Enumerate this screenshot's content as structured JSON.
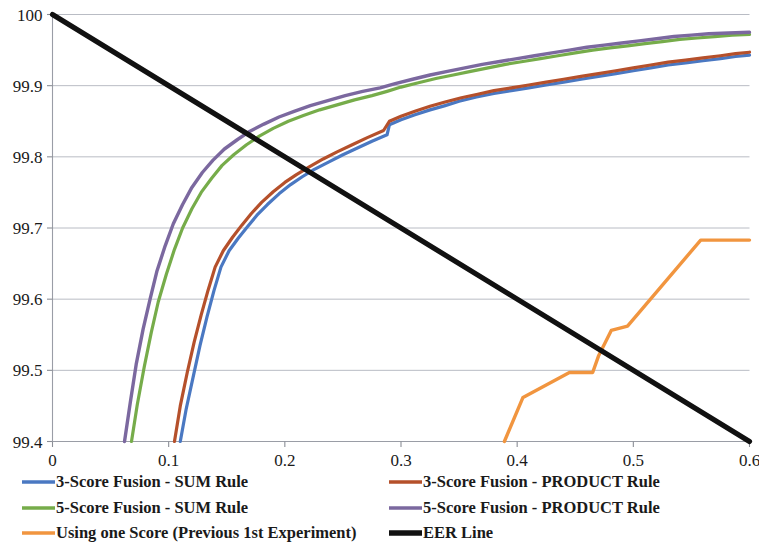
{
  "chart_data": {
    "type": "line",
    "title": "",
    "xlabel": "",
    "ylabel": "",
    "xlim": [
      0,
      0.6
    ],
    "ylim": [
      99.4,
      100
    ],
    "grid": true,
    "legend_position": "bottom",
    "x_ticks": [
      "0",
      "0.1",
      "0.2",
      "0.3",
      "0.4",
      "0.5",
      "0.6"
    ],
    "x_tick_values": [
      0,
      0.1,
      0.2,
      0.3,
      0.4,
      0.5,
      0.6
    ],
    "y_ticks": [
      "99.4",
      "99.5",
      "99.6",
      "99.7",
      "99.8",
      "99.9",
      "100"
    ],
    "y_tick_values": [
      99.4,
      99.5,
      99.6,
      99.7,
      99.8,
      99.9,
      100
    ],
    "series": [
      {
        "name": "3-Score Fusion - SUM Rule",
        "color": "#4A78C2",
        "width": 3.2,
        "points": [
          [
            0.11,
            99.4
          ],
          [
            0.115,
            99.445
          ],
          [
            0.121,
            99.49
          ],
          [
            0.127,
            99.535
          ],
          [
            0.133,
            99.575
          ],
          [
            0.139,
            99.612
          ],
          [
            0.145,
            99.645
          ],
          [
            0.152,
            99.668
          ],
          [
            0.16,
            99.686
          ],
          [
            0.168,
            99.702
          ],
          [
            0.176,
            99.718
          ],
          [
            0.185,
            99.733
          ],
          [
            0.195,
            99.748
          ],
          [
            0.205,
            99.761
          ],
          [
            0.215,
            99.772
          ],
          [
            0.225,
            99.782
          ],
          [
            0.238,
            99.793
          ],
          [
            0.25,
            99.803
          ],
          [
            0.262,
            99.812
          ],
          [
            0.275,
            99.822
          ],
          [
            0.288,
            99.831
          ],
          [
            0.29,
            99.845
          ],
          [
            0.3,
            99.852
          ],
          [
            0.312,
            99.859
          ],
          [
            0.325,
            99.866
          ],
          [
            0.338,
            99.872
          ],
          [
            0.35,
            99.878
          ],
          [
            0.365,
            99.884
          ],
          [
            0.38,
            99.889
          ],
          [
            0.395,
            99.893
          ],
          [
            0.41,
            99.897
          ],
          [
            0.425,
            99.901
          ],
          [
            0.44,
            99.905
          ],
          [
            0.455,
            99.909
          ],
          [
            0.47,
            99.913
          ],
          [
            0.485,
            99.917
          ],
          [
            0.5,
            99.921
          ],
          [
            0.515,
            99.925
          ],
          [
            0.53,
            99.929
          ],
          [
            0.545,
            99.932
          ],
          [
            0.56,
            99.935
          ],
          [
            0.575,
            99.938
          ],
          [
            0.588,
            99.941
          ],
          [
            0.6,
            99.943
          ]
        ]
      },
      {
        "name": "3-Score Fusion - PRODUCT Rule",
        "color": "#B5502B",
        "width": 3.2,
        "points": [
          [
            0.105,
            99.4
          ],
          [
            0.11,
            99.45
          ],
          [
            0.116,
            99.497
          ],
          [
            0.122,
            99.54
          ],
          [
            0.128,
            99.578
          ],
          [
            0.134,
            99.613
          ],
          [
            0.14,
            99.645
          ],
          [
            0.147,
            99.668
          ],
          [
            0.155,
            99.687
          ],
          [
            0.163,
            99.704
          ],
          [
            0.171,
            99.72
          ],
          [
            0.18,
            99.736
          ],
          [
            0.19,
            99.751
          ],
          [
            0.2,
            99.764
          ],
          [
            0.21,
            99.775
          ],
          [
            0.221,
            99.786
          ],
          [
            0.233,
            99.797
          ],
          [
            0.245,
            99.807
          ],
          [
            0.258,
            99.817
          ],
          [
            0.271,
            99.827
          ],
          [
            0.285,
            99.837
          ],
          [
            0.29,
            99.85
          ],
          [
            0.3,
            99.857
          ],
          [
            0.312,
            99.864
          ],
          [
            0.325,
            99.871
          ],
          [
            0.338,
            99.877
          ],
          [
            0.352,
            99.883
          ],
          [
            0.366,
            99.888
          ],
          [
            0.38,
            99.893
          ],
          [
            0.395,
            99.897
          ],
          [
            0.41,
            99.901
          ],
          [
            0.425,
            99.905
          ],
          [
            0.44,
            99.909
          ],
          [
            0.455,
            99.913
          ],
          [
            0.47,
            99.917
          ],
          [
            0.485,
            99.921
          ],
          [
            0.5,
            99.925
          ],
          [
            0.515,
            99.929
          ],
          [
            0.53,
            99.933
          ],
          [
            0.545,
            99.936
          ],
          [
            0.56,
            99.939
          ],
          [
            0.575,
            99.942
          ],
          [
            0.588,
            99.945
          ],
          [
            0.6,
            99.947
          ]
        ]
      },
      {
        "name": "5-Score Fusion - SUM Rule",
        "color": "#76AC4A",
        "width": 3.2,
        "points": [
          [
            0.068,
            99.4
          ],
          [
            0.073,
            99.452
          ],
          [
            0.079,
            99.505
          ],
          [
            0.085,
            99.553
          ],
          [
            0.091,
            99.596
          ],
          [
            0.098,
            99.635
          ],
          [
            0.105,
            99.67
          ],
          [
            0.112,
            99.7
          ],
          [
            0.12,
            99.727
          ],
          [
            0.128,
            99.75
          ],
          [
            0.137,
            99.77
          ],
          [
            0.146,
            99.788
          ],
          [
            0.156,
            99.803
          ],
          [
            0.167,
            99.817
          ],
          [
            0.178,
            99.829
          ],
          [
            0.19,
            99.84
          ],
          [
            0.203,
            99.85
          ],
          [
            0.216,
            99.858
          ],
          [
            0.23,
            99.866
          ],
          [
            0.245,
            99.873
          ],
          [
            0.26,
            99.88
          ],
          [
            0.275,
            99.886
          ],
          [
            0.288,
            99.892
          ],
          [
            0.3,
            99.898
          ],
          [
            0.315,
            99.904
          ],
          [
            0.33,
            99.91
          ],
          [
            0.345,
            99.915
          ],
          [
            0.36,
            99.92
          ],
          [
            0.375,
            99.925
          ],
          [
            0.39,
            99.93
          ],
          [
            0.405,
            99.934
          ],
          [
            0.42,
            99.938
          ],
          [
            0.435,
            99.942
          ],
          [
            0.45,
            99.946
          ],
          [
            0.465,
            99.95
          ],
          [
            0.48,
            99.953
          ],
          [
            0.495,
            99.956
          ],
          [
            0.51,
            99.959
          ],
          [
            0.525,
            99.962
          ],
          [
            0.54,
            99.965
          ],
          [
            0.555,
            99.967
          ],
          [
            0.57,
            99.969
          ],
          [
            0.585,
            99.971
          ],
          [
            0.6,
            99.972
          ]
        ]
      },
      {
        "name": "5-Score Fusion - PRODUCT Rule",
        "color": "#7B689F",
        "width": 3.4,
        "points": [
          [
            0.062,
            99.4
          ],
          [
            0.067,
            99.455
          ],
          [
            0.072,
            99.508
          ],
          [
            0.078,
            99.558
          ],
          [
            0.084,
            99.6
          ],
          [
            0.09,
            99.64
          ],
          [
            0.097,
            99.675
          ],
          [
            0.104,
            99.706
          ],
          [
            0.112,
            99.733
          ],
          [
            0.12,
            99.757
          ],
          [
            0.129,
            99.778
          ],
          [
            0.138,
            99.795
          ],
          [
            0.148,
            99.811
          ],
          [
            0.159,
            99.824
          ],
          [
            0.17,
            99.836
          ],
          [
            0.182,
            99.846
          ],
          [
            0.195,
            99.856
          ],
          [
            0.208,
            99.864
          ],
          [
            0.222,
            99.872
          ],
          [
            0.237,
            99.879
          ],
          [
            0.252,
            99.886
          ],
          [
            0.267,
            99.892
          ],
          [
            0.282,
            99.897
          ],
          [
            0.295,
            99.903
          ],
          [
            0.31,
            99.909
          ],
          [
            0.325,
            99.915
          ],
          [
            0.34,
            99.92
          ],
          [
            0.355,
            99.925
          ],
          [
            0.37,
            99.93
          ],
          [
            0.385,
            99.934
          ],
          [
            0.4,
            99.938
          ],
          [
            0.415,
            99.942
          ],
          [
            0.43,
            99.946
          ],
          [
            0.445,
            99.95
          ],
          [
            0.46,
            99.954
          ],
          [
            0.475,
            99.957
          ],
          [
            0.49,
            99.96
          ],
          [
            0.505,
            99.963
          ],
          [
            0.52,
            99.966
          ],
          [
            0.535,
            99.969
          ],
          [
            0.55,
            99.971
          ],
          [
            0.565,
            99.973
          ],
          [
            0.582,
            99.974
          ],
          [
            0.6,
            99.975
          ]
        ]
      },
      {
        "name": "Using one Score (Previous 1st Experiment)",
        "color": "#F1953F",
        "width": 3.4,
        "points": [
          [
            0.389,
            99.4
          ],
          [
            0.405,
            99.462
          ],
          [
            0.445,
            99.497
          ],
          [
            0.465,
            99.497
          ],
          [
            0.47,
            99.52
          ],
          [
            0.481,
            99.556
          ],
          [
            0.495,
            99.562
          ],
          [
            0.558,
            99.683
          ],
          [
            0.6,
            99.683
          ]
        ]
      },
      {
        "name": "EER Line",
        "color": "#111111",
        "width": 5.2,
        "points": [
          [
            0.0,
            100.0
          ],
          [
            0.6,
            99.4
          ]
        ]
      }
    ]
  },
  "legend": {
    "entries": [
      {
        "label": "3-Score Fusion - SUM Rule",
        "color": "#4A78C2",
        "width": 3.4
      },
      {
        "label": "3-Score Fusion - PRODUCT Rule",
        "color": "#B5502B",
        "width": 3.4
      },
      {
        "label": "5-Score Fusion - SUM Rule",
        "color": "#76AC4A",
        "width": 3.4
      },
      {
        "label": "5-Score Fusion - PRODUCT Rule",
        "color": "#7B689F",
        "width": 3.4
      },
      {
        "label": "Using one Score (Previous 1st Experiment)",
        "color": "#F1953F",
        "width": 3.4
      },
      {
        "label": "EER Line",
        "color": "#111111",
        "width": 5.4
      }
    ]
  }
}
